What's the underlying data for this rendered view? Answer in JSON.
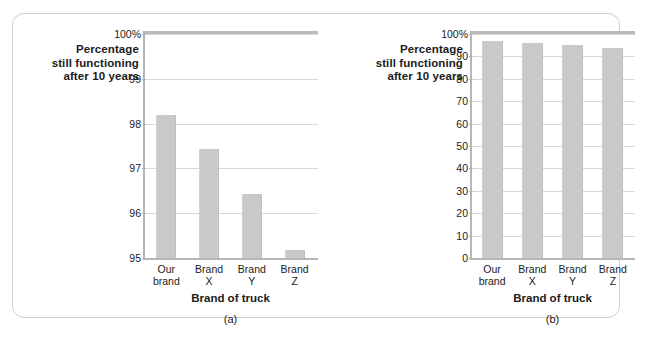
{
  "figure": {
    "frame_border_color": "#cfcfcf",
    "bar_color": "#c9c9c9",
    "grid_color": "#d9d9d9",
    "axis_color": "#b6b6b6"
  },
  "chart_data": [
    {
      "type": "bar",
      "panel_label": "(a)",
      "title": "",
      "ylabel": "Percentage still functioning after 10 years",
      "ylabel_lines": [
        "Percentage",
        "still functioning",
        "after 10 years"
      ],
      "xlabel": "Brand of truck",
      "categories": [
        "Our brand",
        "Brand X",
        "Brand Y",
        "Brand Z"
      ],
      "category_lines": [
        [
          "Our",
          "brand"
        ],
        [
          "Brand",
          "X"
        ],
        [
          "Brand",
          "Y"
        ],
        [
          "Brand",
          "Z"
        ]
      ],
      "values": [
        98.25,
        97.5,
        96.5,
        95.25
      ],
      "ylim": [
        95,
        100
      ],
      "yticks": [
        95,
        96,
        97,
        98,
        99,
        100
      ],
      "ytick_labels": [
        "95",
        "96",
        "97",
        "98",
        "99",
        "100%"
      ],
      "grid": true,
      "legend": "none"
    },
    {
      "type": "bar",
      "panel_label": "(b)",
      "title": "",
      "ylabel": "Percentage still functioning after 10 years",
      "ylabel_lines": [
        "Percentage",
        "still functioning",
        "after 10 years"
      ],
      "xlabel": "Brand of truck",
      "categories": [
        "Our brand",
        "Brand X",
        "Brand Y",
        "Brand Z"
      ],
      "category_lines": [
        [
          "Our",
          "brand"
        ],
        [
          "Brand",
          "X"
        ],
        [
          "Brand",
          "Y"
        ],
        [
          "Brand",
          "Z"
        ]
      ],
      "values": [
        98.25,
        97.5,
        96.5,
        95.25
      ],
      "ylim": [
        0,
        100
      ],
      "yticks": [
        0,
        10,
        20,
        30,
        40,
        50,
        60,
        70,
        80,
        90,
        100
      ],
      "ytick_labels": [
        "0",
        "10",
        "20",
        "30",
        "40",
        "50",
        "60",
        "70",
        "80",
        "90",
        "100%"
      ],
      "grid": true,
      "legend": "none"
    }
  ]
}
